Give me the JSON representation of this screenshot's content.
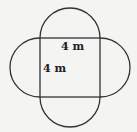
{
  "figure": {
    "shape": "square with four semicircles on each side",
    "labels": {
      "top_side": "4 m",
      "left_side": "4 m"
    },
    "colors": {
      "stroke": "#333333",
      "background": "#f4f4f2"
    }
  }
}
